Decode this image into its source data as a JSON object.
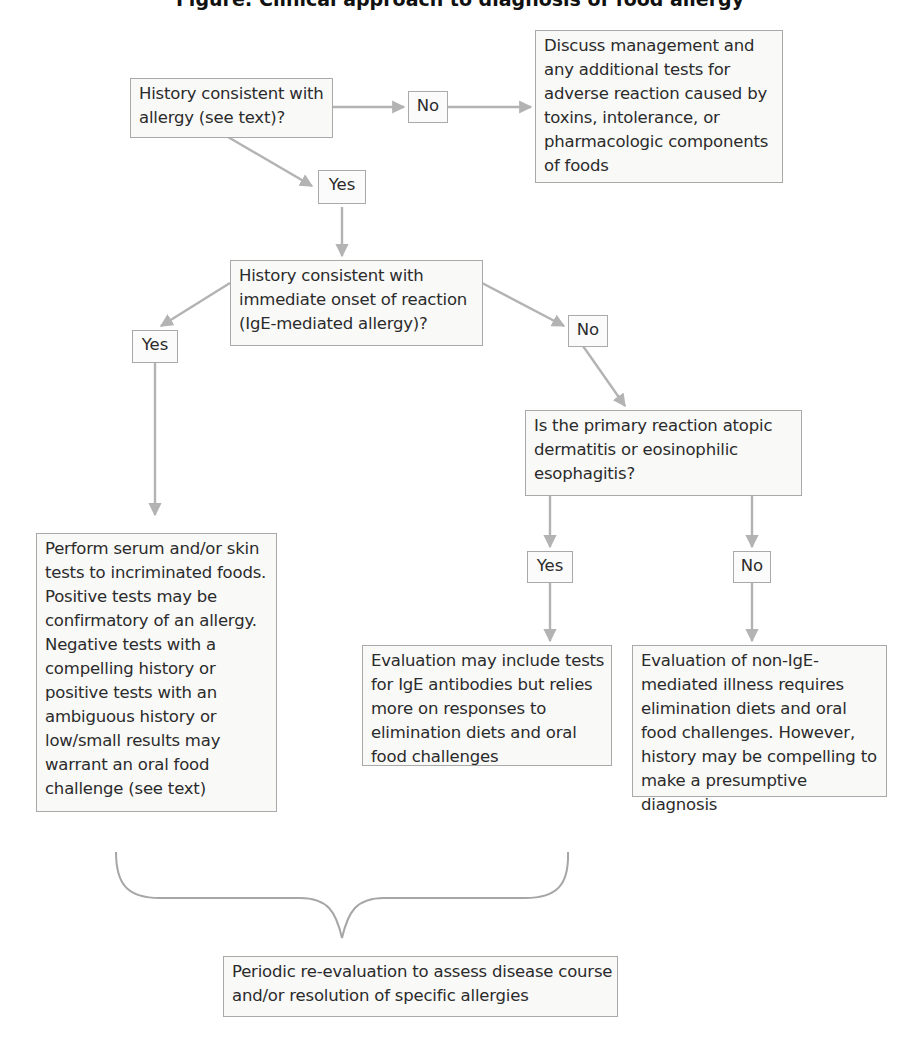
{
  "title": "Figure: Clinical approach to diagnosis of food allergy",
  "colors": {
    "box_border": "#a9a9a9",
    "box_fill": "#f9f9f8",
    "arrow": "#b3b3b3",
    "text": "#2b2b2b"
  },
  "nodes": {
    "history_allergy": {
      "lines": [
        "History consistent with",
        "allergy (see text)?"
      ]
    },
    "discuss_management": {
      "lines": [
        "Discuss management and",
        "any additional tests for",
        "adverse reaction caused by",
        "toxins, intolerance, or",
        "pharmacologic components",
        "of foods"
      ]
    },
    "immediate_onset": {
      "lines": [
        "History consistent with",
        "immediate onset of reaction",
        "(IgE-mediated allergy)?"
      ]
    },
    "primary_reaction": {
      "lines": [
        "Is the primary reaction atopic",
        "dermatitis or eosinophilic",
        "esophagitis?"
      ]
    },
    "serum_skin_tests": {
      "lines": [
        "Perform serum and/or skin",
        "tests to incriminated foods.",
        "Positive tests may be",
        "confirmatory of an allergy.",
        "Negative tests with a",
        "compelling history or",
        "positive tests with an",
        "ambiguous history or",
        "low/small results may",
        "warrant an oral food",
        "challenge (see text)"
      ]
    },
    "ige_antibody_eval": {
      "lines": [
        "Evaluation may include tests",
        "for IgE antibodies but relies",
        "more on responses to",
        "elimination diets and oral",
        "food challenges"
      ]
    },
    "non_ige_eval": {
      "lines": [
        "Evaluation of non-IgE-",
        "mediated illness requires",
        "elimination diets and oral",
        "food challenges. However,",
        "history may be compelling to",
        "make a presumptive",
        "diagnosis"
      ]
    },
    "periodic_reeval": {
      "lines": [
        "Periodic re-evaluation to assess disease course",
        "and/or resolution of specific allergies"
      ]
    }
  },
  "labels": {
    "no_1": "No",
    "yes_1": "Yes",
    "yes_2": "Yes",
    "no_2": "No",
    "yes_3": "Yes",
    "no_3": "No"
  },
  "edges": [
    {
      "from": "history_allergy",
      "label": "No",
      "to": "discuss_management"
    },
    {
      "from": "history_allergy",
      "label": "Yes",
      "to": "immediate_onset"
    },
    {
      "from": "immediate_onset",
      "label": "Yes",
      "to": "serum_skin_tests"
    },
    {
      "from": "immediate_onset",
      "label": "No",
      "to": "primary_reaction"
    },
    {
      "from": "primary_reaction",
      "label": "Yes",
      "to": "ige_antibody_eval"
    },
    {
      "from": "primary_reaction",
      "label": "No",
      "to": "non_ige_eval"
    },
    {
      "from": [
        "serum_skin_tests",
        "non_ige_eval"
      ],
      "label": "",
      "to": "periodic_reeval"
    }
  ]
}
